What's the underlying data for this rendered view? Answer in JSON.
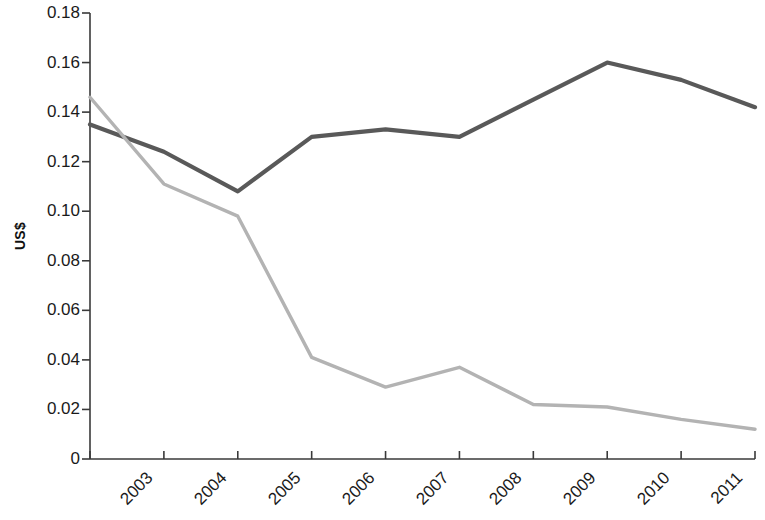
{
  "chart_data": {
    "type": "line",
    "title": "",
    "subtitle": "",
    "xlabel": "",
    "ylabel": "US$",
    "categories": [
      "2003",
      "2004",
      "2005",
      "2006",
      "2007",
      "2008",
      "2009",
      "2010",
      "2011",
      "2012"
    ],
    "x": [
      2003,
      2004,
      2005,
      2006,
      2007,
      2008,
      2009,
      2010,
      2011,
      2012
    ],
    "series": [
      {
        "name": "Dark gray series",
        "color": "#595959",
        "values": [
          0.135,
          0.124,
          0.108,
          0.13,
          0.133,
          0.13,
          0.145,
          0.16,
          0.153,
          0.142
        ]
      },
      {
        "name": "Light gray series",
        "color": "#b3b3b3",
        "values": [
          0.146,
          0.111,
          0.098,
          0.041,
          0.029,
          0.037,
          0.022,
          0.021,
          0.016,
          0.012
        ]
      }
    ],
    "ylim": [
      0,
      0.18
    ],
    "ytick_values": [
      0,
      0.02,
      0.04,
      0.06,
      0.08,
      0.1,
      0.12,
      0.14,
      0.16,
      0.18
    ],
    "ytick_labels": [
      "0",
      "0.02",
      "0.04",
      "0.06",
      "0.08",
      "0.10",
      "0.12",
      "0.14",
      "0.16",
      "0.18"
    ],
    "grid": false,
    "legend": "none",
    "legend_position": "none",
    "annotations": []
  },
  "axes": {
    "y_title": "US$"
  }
}
